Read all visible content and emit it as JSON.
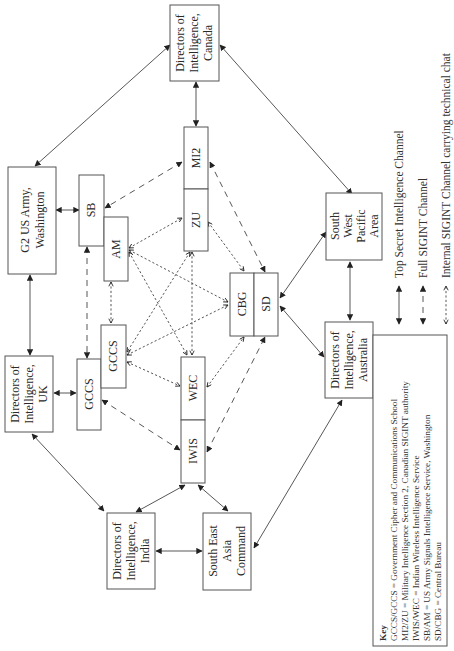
{
  "diagram": {
    "orientation": "rotated -90deg",
    "nodes": {
      "dir_canada": [
        "Directors of",
        "Intelligence,",
        "Canada"
      ],
      "mi2": "MI2",
      "zu": "ZU",
      "g2_us_army": [
        "G2 US Army,",
        "Washington"
      ],
      "sb": "SB",
      "am": "AM",
      "gccs_uk": "GCCS",
      "gccs_2": "GCCS",
      "dir_uk": [
        "Directors of",
        "Intelligence,",
        "UK"
      ],
      "wec": "WEC",
      "iwis": "IWIS",
      "cbg": "CBG",
      "sd": "SD",
      "sw_pacific": [
        "South",
        "West",
        "Pacific",
        "Area"
      ],
      "dir_australia": [
        "Directors of",
        "Intelligence,",
        "Australia"
      ],
      "dir_india": [
        "Directors of",
        "Intelligence,",
        "India"
      ],
      "se_asia_command": [
        "South East",
        "Asia",
        "Command"
      ]
    },
    "legend": [
      {
        "style": "solid",
        "label": "Top Secret Intelligence Channel"
      },
      {
        "style": "dashed",
        "label": "Full SIGINT Channel"
      },
      {
        "style": "dotted",
        "label": "Internal SIGINT Channel carrying technical chat"
      }
    ],
    "key": {
      "title": "Key",
      "lines": [
        "GCCS/GCCS = Government Cipher and Communications School",
        "MI2/ZU = Military Intelligence Section 2, Canadian SIGINT authority",
        "IWIS/WEC = Indian Wireless Intelligence Service",
        "SB/AM = US Army Signals Intelligence Service, Washington",
        "SD/CBG = Central Bureau"
      ]
    },
    "edges": [
      {
        "from": "Directors of Intelligence, Canada",
        "to": "G2 US Army, Washington",
        "type": "solid"
      },
      {
        "from": "Directors of Intelligence, Canada",
        "to": "MI2",
        "type": "solid"
      },
      {
        "from": "Directors of Intelligence, Canada",
        "to": "South West Pacific Area",
        "type": "solid"
      },
      {
        "from": "G2 US Army, Washington",
        "to": "SB",
        "type": "solid"
      },
      {
        "from": "G2 US Army, Washington",
        "to": "Directors of Intelligence, UK",
        "type": "solid"
      },
      {
        "from": "Directors of Intelligence, UK",
        "to": "GCCS",
        "type": "solid"
      },
      {
        "from": "Directors of Intelligence, UK",
        "to": "Directors of Intelligence, India",
        "type": "solid"
      },
      {
        "from": "Directors of Intelligence, India",
        "to": "IWIS",
        "type": "solid"
      },
      {
        "from": "Directors of Intelligence, India",
        "to": "South East Asia Command",
        "type": "solid"
      },
      {
        "from": "IWIS",
        "to": "South East Asia Command",
        "type": "solid"
      },
      {
        "from": "South East Asia Command",
        "to": "Directors of Intelligence, Australia",
        "type": "solid"
      },
      {
        "from": "SD",
        "to": "South West Pacific Area",
        "type": "solid"
      },
      {
        "from": "SD",
        "to": "Directors of Intelligence, Australia",
        "type": "solid"
      },
      {
        "from": "South West Pacific Area",
        "to": "Directors of Intelligence, Australia",
        "type": "solid"
      },
      {
        "from": "SB",
        "to": "MI2",
        "type": "dashed"
      },
      {
        "from": "SB",
        "to": "GCCS",
        "type": "dashed"
      },
      {
        "from": "MI2",
        "to": "SD",
        "type": "dashed"
      },
      {
        "from": "GCCS",
        "to": "IWIS",
        "type": "dashed"
      },
      {
        "from": "IWIS",
        "to": "SD",
        "type": "dashed"
      },
      {
        "from": "AM",
        "to": "ZU",
        "type": "dotted"
      },
      {
        "from": "AM",
        "to": "GCCS",
        "type": "dotted"
      },
      {
        "from": "AM",
        "to": "CBG",
        "type": "dotted"
      },
      {
        "from": "AM",
        "to": "WEC",
        "type": "dotted"
      },
      {
        "from": "ZU",
        "to": "GCCS",
        "type": "dotted"
      },
      {
        "from": "ZU",
        "to": "WEC",
        "type": "dotted"
      },
      {
        "from": "ZU",
        "to": "CBG",
        "type": "dotted"
      },
      {
        "from": "GCCS",
        "to": "CBG",
        "type": "dotted"
      },
      {
        "from": "GCCS",
        "to": "WEC",
        "type": "dotted"
      },
      {
        "from": "WEC",
        "to": "CBG",
        "type": "dotted"
      }
    ]
  }
}
